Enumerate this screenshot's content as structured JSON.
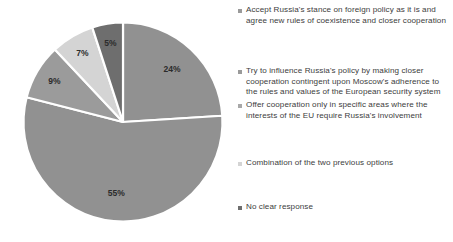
{
  "chart_data": {
    "type": "pie",
    "title": "",
    "subtitle": "",
    "xlabel": "",
    "ylabel": "",
    "grid": false,
    "legend_position": "right",
    "categories": [
      "Accept Russia's stance on foreign policy as it is and agree new rules of coexistence and closer cooperation",
      "Try to influence Russia's policy by making closer cooperation contingent upon Moscow's adherence to the rules and values of the European security system",
      "Offer cooperation only in specific areas where the interests of the EU require Russia's involvement",
      "Combination of the two previous options",
      "No clear response"
    ],
    "values": [
      24,
      55,
      9,
      7,
      5
    ],
    "value_labels": [
      "24%",
      "55%",
      "9%",
      "7%",
      "5%"
    ],
    "colors": [
      "#919191",
      "#919191",
      "#9b9b9b",
      "#d4d4d4",
      "#6e6e6e"
    ],
    "slice_separator_color": "#ffffff",
    "start_angle_deg": 0,
    "direction": "clockwise"
  },
  "legend": {
    "marker_colors": [
      "#9a9a9a",
      "#9a9a9a",
      "#a8a8a8",
      "#d4d4d4",
      "#6e6e6e"
    ],
    "items": [
      {
        "label": "Accept Russia's stance on foreign policy as it is and agree new rules of coexistence and closer cooperation"
      },
      {
        "label": "Try to influence Russia's policy by making closer cooperation contingent upon Moscow's adherence to the rules and values of the European security system"
      },
      {
        "label": "Offer cooperation only in specific areas where the interests of the EU require Russia's involvement"
      },
      {
        "label": "Combination of the two previous options"
      },
      {
        "label": "No clear response"
      }
    ]
  },
  "slice_labels": {
    "s0": "24%",
    "s1": "55%",
    "s2": "9%",
    "s3": "7%",
    "s4": "5%"
  }
}
